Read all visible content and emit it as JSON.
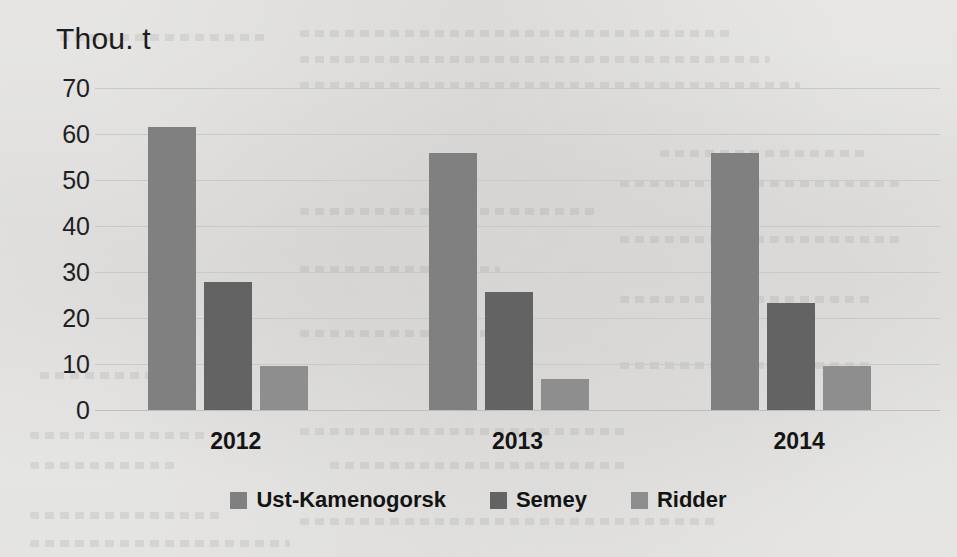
{
  "chart_data": {
    "type": "bar",
    "title": "",
    "axis_unit_label": "Thou. t",
    "xlabel": "",
    "ylabel": "Thou. t",
    "categories": [
      "2012",
      "2013",
      "2014"
    ],
    "series": [
      {
        "name": "Ust-Kamenogorsk",
        "color": "#808080",
        "values": [
          61.5,
          55.8,
          55.9
        ]
      },
      {
        "name": "Semey",
        "color": "#636363",
        "values": [
          27.8,
          25.6,
          23.2
        ]
      },
      {
        "name": "Ridder",
        "color": "#8e8e8e",
        "values": [
          9.6,
          6.7,
          9.5
        ]
      }
    ],
    "ylim": [
      0,
      70
    ],
    "yticks": [
      70,
      60,
      50,
      40,
      30,
      20,
      10,
      0
    ],
    "ytick_labels": [
      "70",
      "60",
      "50",
      "40",
      "30",
      "20",
      "10",
      "0"
    ],
    "grid": true,
    "grid_axis": "y",
    "legend_position": "bottom",
    "legend_entries": [
      "Ust-Kamenogorsk",
      "Semey",
      "Ridder"
    ],
    "background_color": "#f2f2f0",
    "gridline_color": "#c9c9c7",
    "text_color": "#1c1c1c"
  }
}
